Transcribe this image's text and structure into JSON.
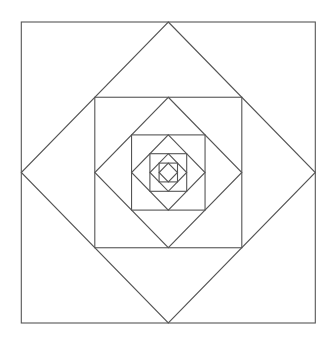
{
  "diagram": {
    "title": "",
    "stroke_color": "#555555",
    "background_color": "#ffffff",
    "stroke_width": 1.1,
    "center": {
      "x": 168.3,
      "y": 172.5
    },
    "outer_half": {
      "x": 147,
      "y": 150.5
    },
    "levels": 5,
    "shapes": [
      {
        "type": "square",
        "level": 1,
        "half_x": 147,
        "half_y": 150.5
      },
      {
        "type": "diamond",
        "level": 1
      },
      {
        "type": "square",
        "level": 2,
        "half_x": 73.5,
        "half_y": 75.25
      },
      {
        "type": "diamond",
        "level": 2
      },
      {
        "type": "square",
        "level": 3,
        "half_x": 36.75,
        "half_y": 37.6
      },
      {
        "type": "diamond",
        "level": 3
      },
      {
        "type": "square",
        "level": 4,
        "half_x": 18.4,
        "half_y": 18.8
      },
      {
        "type": "diamond",
        "level": 4
      },
      {
        "type": "square",
        "level": 5,
        "half_x": 9.2,
        "half_y": 9.4
      },
      {
        "type": "diamond",
        "level": 5
      }
    ]
  }
}
